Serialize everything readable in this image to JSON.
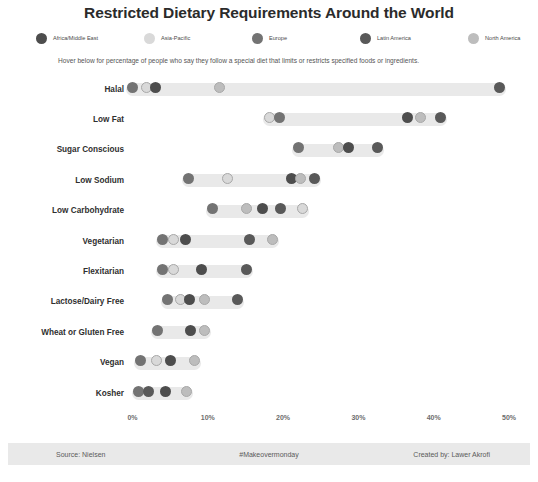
{
  "title": "Restricted Dietary Requirements Around the World",
  "subtitle": "Hover below for percentage of people who say they follow a special diet that limits or restricts specified foods or ingredients.",
  "legend": {
    "position": "top",
    "items": [
      {
        "label": "Africa/Middle East",
        "color": "#4d4d4d"
      },
      {
        "label": "Asia-Pacific",
        "color": "#d9d9d9"
      },
      {
        "label": "Europe",
        "color": "#737373"
      },
      {
        "label": "Latin America",
        "color": "#595959"
      },
      {
        "label": "North America",
        "color": "#bdbdbd"
      }
    ]
  },
  "axis": {
    "ticks": [
      "0%",
      "10%",
      "20%",
      "30%",
      "40%",
      "50%"
    ],
    "min": 0,
    "max": 50
  },
  "footer": {
    "source": "Source: Nielsen",
    "hashtag": "#Makeovermonday",
    "credit": "Created by: Lawer Akrofi"
  },
  "chart_data": {
    "type": "scatter",
    "title": "Restricted Dietary Requirements Around the World",
    "xlabel": "",
    "ylabel": "",
    "xlim": [
      0,
      50
    ],
    "x_tick_labels": [
      "0%",
      "10%",
      "20%",
      "30%",
      "40%",
      "50%"
    ],
    "grid": false,
    "legend_position": "top",
    "series": [
      {
        "name": "Africa/Middle East",
        "color": "#4d4d4d"
      },
      {
        "name": "Asia-Pacific",
        "color": "#d9d9d9"
      },
      {
        "name": "Europe",
        "color": "#737373"
      },
      {
        "name": "Latin America",
        "color": "#595959"
      },
      {
        "name": "North America",
        "color": "#bdbdbd"
      }
    ],
    "categories": [
      "Halal",
      "Low Fat",
      "Sugar Conscious",
      "Low Sodium",
      "Low Carbohydrate",
      "Vegetarian",
      "Flexitarian",
      "Lactose/Dairy Free",
      "Wheat or Gluten Free",
      "Vegan",
      "Kosher"
    ],
    "rows": [
      {
        "category": "Halal",
        "points": [
          {
            "region": "Europe",
            "value": 0.0,
            "color": "#737373"
          },
          {
            "region": "Asia-Pacific",
            "value": 1.9,
            "color": "#d9d9d9"
          },
          {
            "region": "Africa/Middle East",
            "value": 3.1,
            "color": "#4d4d4d"
          },
          {
            "region": "North America",
            "value": 11.5,
            "color": "#bdbdbd"
          },
          {
            "region": "Latin America",
            "value": 48.8,
            "color": "#595959"
          }
        ]
      },
      {
        "category": "Low Fat",
        "points": [
          {
            "region": "Asia-Pacific",
            "value": 18.2,
            "color": "#d9d9d9"
          },
          {
            "region": "Europe",
            "value": 19.5,
            "color": "#737373"
          },
          {
            "region": "Africa/Middle East",
            "value": 36.5,
            "color": "#4d4d4d"
          },
          {
            "region": "North America",
            "value": 38.2,
            "color": "#bdbdbd"
          },
          {
            "region": "Latin America",
            "value": 40.9,
            "color": "#595959"
          }
        ]
      },
      {
        "category": "Sugar Conscious",
        "points": [
          {
            "region": "Europe",
            "value": 22.1,
            "color": "#737373"
          },
          {
            "region": "North America",
            "value": 27.4,
            "color": "#bdbdbd"
          },
          {
            "region": "Africa/Middle East",
            "value": 28.7,
            "color": "#4d4d4d"
          },
          {
            "region": "Latin America",
            "value": 32.5,
            "color": "#595959"
          }
        ]
      },
      {
        "category": "Low Sodium",
        "points": [
          {
            "region": "Europe",
            "value": 7.5,
            "color": "#737373"
          },
          {
            "region": "Asia-Pacific",
            "value": 12.6,
            "color": "#d9d9d9"
          },
          {
            "region": "Africa/Middle East",
            "value": 21.1,
            "color": "#4d4d4d"
          },
          {
            "region": "North America",
            "value": 22.3,
            "color": "#bdbdbd"
          },
          {
            "region": "Latin America",
            "value": 24.2,
            "color": "#595959"
          }
        ]
      },
      {
        "category": "Low Carbohydrate",
        "points": [
          {
            "region": "Europe",
            "value": 10.6,
            "color": "#737373"
          },
          {
            "region": "North America",
            "value": 15.1,
            "color": "#bdbdbd"
          },
          {
            "region": "Africa/Middle East",
            "value": 17.2,
            "color": "#4d4d4d"
          },
          {
            "region": "Latin America",
            "value": 19.7,
            "color": "#595959"
          },
          {
            "region": "Asia-Pacific",
            "value": 22.6,
            "color": "#d9d9d9"
          }
        ]
      },
      {
        "category": "Vegetarian",
        "points": [
          {
            "region": "Europe",
            "value": 4.0,
            "color": "#737373"
          },
          {
            "region": "Asia-Pacific",
            "value": 5.4,
            "color": "#d9d9d9"
          },
          {
            "region": "Africa/Middle East",
            "value": 7.1,
            "color": "#4d4d4d"
          },
          {
            "region": "Latin America",
            "value": 15.6,
            "color": "#595959"
          },
          {
            "region": "North America",
            "value": 18.6,
            "color": "#bdbdbd"
          }
        ]
      },
      {
        "category": "Flexitarian",
        "points": [
          {
            "region": "Europe",
            "value": 4.0,
            "color": "#737373"
          },
          {
            "region": "Asia-Pacific",
            "value": 5.4,
            "color": "#d9d9d9"
          },
          {
            "region": "Africa/Middle East",
            "value": 9.2,
            "color": "#4d4d4d"
          },
          {
            "region": "Latin America",
            "value": 15.2,
            "color": "#595959"
          }
        ]
      },
      {
        "category": "Lactose/Dairy Free",
        "points": [
          {
            "region": "Europe",
            "value": 4.7,
            "color": "#737373"
          },
          {
            "region": "Asia-Pacific",
            "value": 6.4,
            "color": "#d9d9d9"
          },
          {
            "region": "Africa/Middle East",
            "value": 7.6,
            "color": "#4d4d4d"
          },
          {
            "region": "North America",
            "value": 9.5,
            "color": "#bdbdbd"
          },
          {
            "region": "Latin America",
            "value": 13.9,
            "color": "#595959"
          }
        ]
      },
      {
        "category": "Wheat or Gluten Free",
        "points": [
          {
            "region": "Europe",
            "value": 3.3,
            "color": "#737373"
          },
          {
            "region": "Africa/Middle East",
            "value": 7.7,
            "color": "#4d4d4d"
          },
          {
            "region": "North America",
            "value": 9.5,
            "color": "#bdbdbd"
          }
        ]
      },
      {
        "category": "Vegan",
        "points": [
          {
            "region": "Europe",
            "value": 1.1,
            "color": "#737373"
          },
          {
            "region": "Asia-Pacific",
            "value": 3.2,
            "color": "#d9d9d9"
          },
          {
            "region": "Africa/Middle East",
            "value": 5.1,
            "color": "#4d4d4d"
          },
          {
            "region": "North America",
            "value": 8.3,
            "color": "#bdbdbd"
          }
        ]
      },
      {
        "category": "Kosher",
        "points": [
          {
            "region": "Europe",
            "value": 0.8,
            "color": "#737373"
          },
          {
            "region": "Latin America",
            "value": 2.1,
            "color": "#595959"
          },
          {
            "region": "Africa/Middle East",
            "value": 4.4,
            "color": "#4d4d4d"
          },
          {
            "region": "North America",
            "value": 7.2,
            "color": "#bdbdbd"
          }
        ]
      }
    ]
  }
}
